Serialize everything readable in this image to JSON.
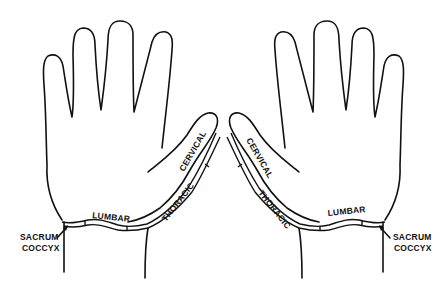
{
  "diagram": {
    "background": "#ffffff",
    "stroke_color": "#111111",
    "hands": [
      {
        "side": "left",
        "labels": {
          "cervical": "CERVICAL",
          "thoracic": "THORACIC",
          "lumbar": "LUMBAR",
          "sacrum": "SACRUM",
          "coccyx": "COCCYX"
        }
      },
      {
        "side": "right",
        "labels": {
          "cervical": "CERVICAL",
          "thoracic": "THORACIC",
          "lumbar": "LUMBAR",
          "sacrum": "SACRUM",
          "coccyx": "COCCYX"
        }
      }
    ]
  }
}
